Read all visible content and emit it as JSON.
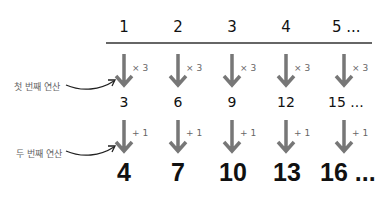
{
  "input_row": [
    "1",
    "2",
    "3",
    "4",
    "5 ..."
  ],
  "middle_row": [
    "3",
    "6",
    "9",
    "12",
    "15 ..."
  ],
  "output_row": [
    "4",
    "7",
    "10",
    "13",
    "16 ..."
  ],
  "first_operation": {
    "label": "첫 번째 연산",
    "op": "× 3"
  },
  "second_operation": {
    "label": "두 번째 연산",
    "op": "+ 1"
  },
  "colors": {
    "arrow": "#777777",
    "text": "#111111",
    "label": "#666666"
  }
}
